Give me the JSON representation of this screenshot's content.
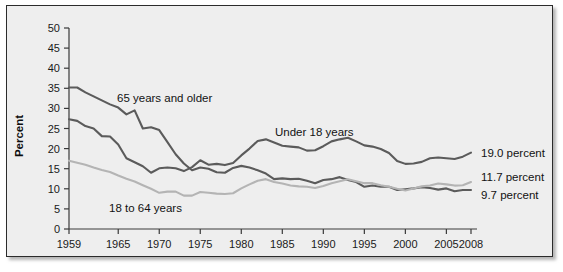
{
  "chart_data": {
    "type": "line",
    "title": "",
    "xlabel": "",
    "ylabel": "Percent",
    "xlim": [
      1959,
      2008
    ],
    "ylim": [
      0,
      50
    ],
    "grid": false,
    "legend_position": "inline-annotations",
    "xticks": [
      "1959",
      "1965",
      "1970",
      "1975",
      "1980",
      "1985",
      "1990",
      "1995",
      "2000",
      "2005",
      "2008"
    ],
    "xtick_values": [
      1959,
      1965,
      1970,
      1975,
      1980,
      1985,
      1990,
      1995,
      2000,
      2005,
      2008
    ],
    "yticks": [
      "0",
      "5",
      "10",
      "15",
      "20",
      "25",
      "30",
      "35",
      "40",
      "45",
      "50"
    ],
    "ytick_values": [
      0,
      5,
      10,
      15,
      20,
      25,
      30,
      35,
      40,
      45,
      50
    ],
    "x": [
      1959,
      1960,
      1961,
      1962,
      1963,
      1964,
      1965,
      1966,
      1967,
      1968,
      1969,
      1970,
      1971,
      1972,
      1973,
      1974,
      1975,
      1976,
      1977,
      1978,
      1979,
      1980,
      1981,
      1982,
      1983,
      1984,
      1985,
      1986,
      1987,
      1988,
      1989,
      1990,
      1991,
      1992,
      1993,
      1994,
      1995,
      1996,
      1997,
      1998,
      1999,
      2000,
      2001,
      2002,
      2003,
      2004,
      2005,
      2006,
      2007,
      2008
    ],
    "series": [
      {
        "name": "65 years and older",
        "color": "#5b5b5b",
        "annotation": "65 years and older",
        "end_label": "9.7 percent",
        "end_value": 9.7,
        "values": [
          35.2,
          35.2,
          34.0,
          33.0,
          32.0,
          31.0,
          30.2,
          28.5,
          29.5,
          25.0,
          25.3,
          24.6,
          21.6,
          18.6,
          16.3,
          14.6,
          15.3,
          15.0,
          14.1,
          14.0,
          15.2,
          15.7,
          15.3,
          14.6,
          13.8,
          12.4,
          12.6,
          12.4,
          12.5,
          12.0,
          11.4,
          12.2,
          12.4,
          12.9,
          12.2,
          11.7,
          10.5,
          10.8,
          10.5,
          10.5,
          9.7,
          9.9,
          10.1,
          10.4,
          10.2,
          9.8,
          10.1,
          9.4,
          9.7,
          9.7
        ]
      },
      {
        "name": "Under 18 years",
        "color": "#5b5b5b",
        "annotation": "Under 18 years",
        "end_label": "19.0 percent",
        "end_value": 19.0,
        "values": [
          27.3,
          26.9,
          25.6,
          25.0,
          23.1,
          23.0,
          21.0,
          17.6,
          16.6,
          15.6,
          14.0,
          15.1,
          15.3,
          15.1,
          14.4,
          15.4,
          17.1,
          16.0,
          16.2,
          15.9,
          16.4,
          18.3,
          20.0,
          21.9,
          22.3,
          21.5,
          20.7,
          20.5,
          20.3,
          19.5,
          19.6,
          20.6,
          21.8,
          22.3,
          22.7,
          21.8,
          20.8,
          20.5,
          19.9,
          18.9,
          16.9,
          16.2,
          16.3,
          16.7,
          17.6,
          17.8,
          17.6,
          17.4,
          18.0,
          19.0
        ]
      },
      {
        "name": "18 to 64 years",
        "color": "#b4b4b4",
        "annotation": "18 to 64 years",
        "end_label": "11.7 percent",
        "end_value": 11.7,
        "values": [
          17.0,
          16.5,
          16.0,
          15.3,
          14.7,
          14.2,
          13.3,
          12.5,
          11.8,
          10.9,
          10.0,
          9.0,
          9.3,
          9.3,
          8.3,
          8.3,
          9.2,
          9.0,
          8.8,
          8.7,
          8.9,
          10.1,
          11.1,
          12.0,
          12.4,
          11.7,
          11.3,
          10.8,
          10.6,
          10.5,
          10.2,
          10.7,
          11.4,
          11.9,
          12.4,
          11.9,
          11.4,
          11.4,
          10.9,
          10.5,
          10.0,
          9.6,
          10.1,
          10.6,
          10.8,
          11.3,
          11.1,
          10.8,
          10.9,
          11.7
        ]
      }
    ]
  },
  "annotations": {
    "series_65_plus": "65 years and older",
    "series_under18": "Under 18 years",
    "series_18_64": "18 to 64 years",
    "end_19_0": "19.0 percent",
    "end_11_7": "11.7 percent",
    "end_9_7": "9.7 percent"
  },
  "axis": {
    "y_title": "Percent"
  },
  "colors": {
    "dark_series": "#5b5b5b",
    "light_series": "#b4b4b4",
    "panel_background": "#eeeeee",
    "frame_border": "#2b2b2b",
    "text": "#121212"
  }
}
